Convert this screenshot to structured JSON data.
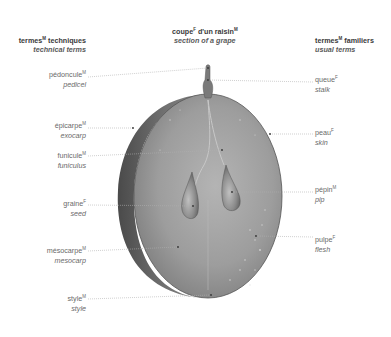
{
  "header": {
    "left": {
      "fr": "termes",
      "fr_gender": "M",
      "fr_rest": " techniques",
      "en": "technical terms"
    },
    "center": {
      "fr": "coupe",
      "fr_gender": "F",
      "fr_rest": " d'un raisin",
      "fr_gender2": "M",
      "en": "section of a grape"
    },
    "right": {
      "fr": "termes",
      "fr_gender": "M",
      "fr_rest": " familiers",
      "en": "usual terms"
    }
  },
  "labels_left": [
    {
      "fr": "pédoncule",
      "gender": "M",
      "en": "pedicel"
    },
    {
      "fr": "épicarpe",
      "gender": "M",
      "en": "exocarp"
    },
    {
      "fr": "funicule",
      "gender": "M",
      "en": "funiculus"
    },
    {
      "fr": "graine",
      "gender": "F",
      "en": "seed"
    },
    {
      "fr": "mésocarpe",
      "gender": "M",
      "en": "mesocarp"
    },
    {
      "fr": "style",
      "gender": "M",
      "en": "style"
    }
  ],
  "labels_right": [
    {
      "fr": "queue",
      "gender": "F",
      "en": "stalk"
    },
    {
      "fr": "peau",
      "gender": "F",
      "en": "skin"
    },
    {
      "fr": "pépin",
      "gender": "M",
      "en": "pip"
    },
    {
      "fr": "pulpe",
      "gender": "F",
      "en": "flesh"
    }
  ],
  "colors": {
    "text_dark": "#3a3a3a",
    "text_label": "#6a6a6a",
    "leader_line": "#b0b0b0",
    "grape_flesh": "#9a9a9a",
    "grape_rim": "#5e5e5e"
  }
}
